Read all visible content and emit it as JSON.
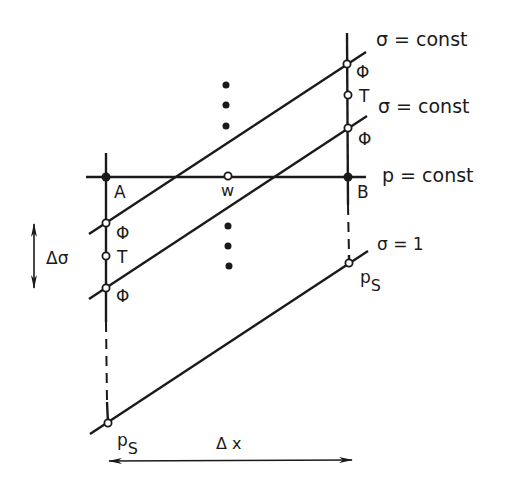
{
  "labels": {
    "sigma_const_top": "σ = const",
    "sigma_const_mid": "σ = const",
    "p_const": "p = const",
    "sigma_one": "σ = 1",
    "point_a": "A",
    "point_b": "B",
    "point_w": "w",
    "phi_right_top": "Φ",
    "t_right": "T",
    "phi_right_mid": "Φ",
    "phi_left_top": "Φ",
    "t_left": "T",
    "phi_left_bottom": "Φ",
    "ps_right_main": "p",
    "ps_right_sub": "S",
    "ps_left_main": "p",
    "ps_left_sub": "S",
    "delta_sigma": "Δσ",
    "delta_x": "Δ x"
  },
  "colors": {
    "ink": "#1a1a1a",
    "background": "#ffffff"
  }
}
